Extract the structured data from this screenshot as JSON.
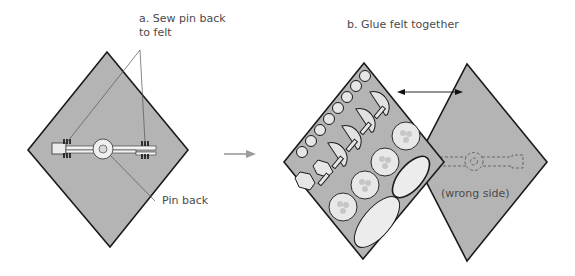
{
  "diagram": {
    "step_a": {
      "title": "a. Sew pin back\nto felt",
      "callout_pin_back": "Pin back"
    },
    "step_b": {
      "title": "b. Glue felt together",
      "callout_wrong_side": "(wrong side)"
    },
    "colors": {
      "felt": "#b4b4b4",
      "outline": "#1a1a1a",
      "piece_fill": "#e8e8e8",
      "arrow": "#9a9a9a",
      "text": "#4a4a4a"
    }
  }
}
